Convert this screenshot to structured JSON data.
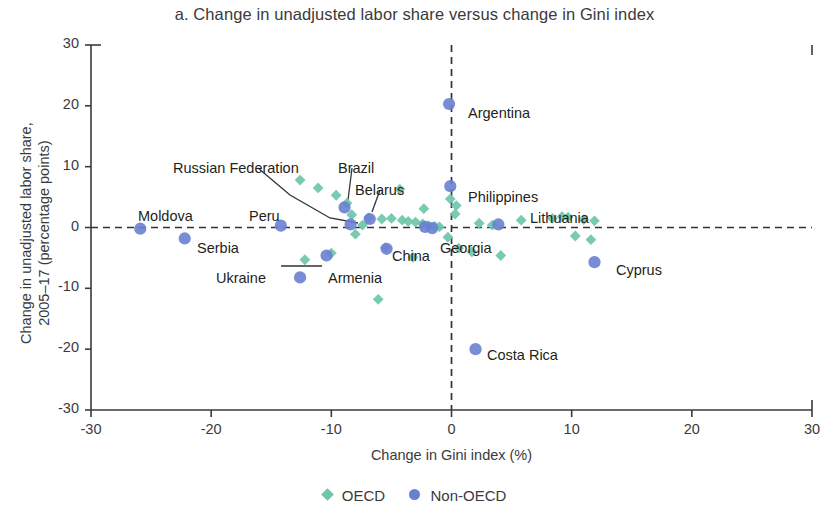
{
  "chart_data": {
    "type": "scatter",
    "title": "a. Change in unadjusted labor share versus change in Gini index",
    "xlabel": "Change in Gini index (%)",
    "ylabel": "Change in unadjusted labor share, 2005–17 (percentage points)",
    "ylabel_line1": "Change in unadjusted labor share,",
    "ylabel_line2": "2005–17 (percentage points)",
    "xlim": [
      -30,
      30
    ],
    "ylim": [
      -30,
      30
    ],
    "xticks": [
      "-30",
      "-20",
      "-10",
      "0",
      "10",
      "20",
      "30"
    ],
    "xtick_values": [
      -30,
      -20,
      -10,
      0,
      10,
      20,
      30
    ],
    "yticks": [
      "30",
      "20",
      "10",
      "0",
      "-10",
      "-20",
      "-30"
    ],
    "ytick_values": [
      30,
      20,
      10,
      0,
      -10,
      -20,
      -30
    ],
    "grid": false,
    "reference_lines": [
      {
        "axis": "y",
        "value": 0,
        "style": "dashed"
      },
      {
        "axis": "x",
        "value": 0,
        "style": "dashed"
      }
    ],
    "legend_position": "bottom-center",
    "colors": {
      "oecd": "#6ec5ab",
      "non_oecd": "#6a7fd2",
      "axis": "#3a3a3c",
      "text": "#231f20"
    },
    "series": [
      {
        "name": "OECD",
        "marker": "diamond",
        "color": "#6ec5ab",
        "points": [
          {
            "x": -12.6,
            "y": 7.8
          },
          {
            "x": -11.1,
            "y": 6.5
          },
          {
            "x": -9.6,
            "y": 5.3
          },
          {
            "x": -8.7,
            "y": 4.0
          },
          {
            "x": -8.3,
            "y": 2.1
          },
          {
            "x": -7.4,
            "y": 0.4
          },
          {
            "x": -6.9,
            "y": 1.6
          },
          {
            "x": -8.0,
            "y": -1.1
          },
          {
            "x": -5.8,
            "y": 1.4
          },
          {
            "x": -5.0,
            "y": 1.5
          },
          {
            "x": -4.3,
            "y": 6.3
          },
          {
            "x": -4.1,
            "y": 1.2
          },
          {
            "x": -3.6,
            "y": 1.0
          },
          {
            "x": -3.0,
            "y": 0.9
          },
          {
            "x": -2.4,
            "y": 0.6
          },
          {
            "x": -1.9,
            "y": 0.3
          },
          {
            "x": -1.4,
            "y": 0.2
          },
          {
            "x": -1.0,
            "y": 0.1
          },
          {
            "x": -2.3,
            "y": 3.1
          },
          {
            "x": -0.1,
            "y": 4.7
          },
          {
            "x": 0.4,
            "y": 3.6
          },
          {
            "x": 0.3,
            "y": 2.2
          },
          {
            "x": -0.3,
            "y": -1.6
          },
          {
            "x": 0.6,
            "y": -3.4
          },
          {
            "x": 1.7,
            "y": -4.0
          },
          {
            "x": 2.3,
            "y": 0.7
          },
          {
            "x": 3.4,
            "y": 0.4
          },
          {
            "x": 4.1,
            "y": -4.6
          },
          {
            "x": 5.8,
            "y": 1.2
          },
          {
            "x": 8.4,
            "y": 1.5
          },
          {
            "x": 9.2,
            "y": 1.8
          },
          {
            "x": 9.7,
            "y": 1.7
          },
          {
            "x": 11.0,
            "y": 1.3
          },
          {
            "x": 11.9,
            "y": 1.1
          },
          {
            "x": 10.3,
            "y": -1.4
          },
          {
            "x": 11.6,
            "y": -2.0
          },
          {
            "x": -12.2,
            "y": -5.3
          },
          {
            "x": -10.0,
            "y": -4.2
          },
          {
            "x": -6.1,
            "y": -11.8
          },
          {
            "x": -3.2,
            "y": -4.9
          },
          {
            "x": -5.5,
            "y": -3.3
          }
        ]
      },
      {
        "name": "Non-OECD",
        "marker": "circle",
        "color": "#6a7fd2",
        "points": [
          {
            "x": -25.9,
            "y": -0.2
          },
          {
            "x": -22.2,
            "y": -1.8
          },
          {
            "x": -14.2,
            "y": 0.3
          },
          {
            "x": -12.6,
            "y": -8.2
          },
          {
            "x": -10.4,
            "y": -4.6
          },
          {
            "x": -8.9,
            "y": 3.3
          },
          {
            "x": -8.4,
            "y": 0.5
          },
          {
            "x": -6.8,
            "y": 1.4
          },
          {
            "x": -5.4,
            "y": -3.5
          },
          {
            "x": -2.2,
            "y": 0.1
          },
          {
            "x": -1.6,
            "y": -0.1
          },
          {
            "x": -0.2,
            "y": 20.3
          },
          {
            "x": -0.1,
            "y": 6.8
          },
          {
            "x": 3.9,
            "y": 0.5
          },
          {
            "x": 11.9,
            "y": -5.7
          },
          {
            "x": 2.0,
            "y": -20.0
          }
        ]
      }
    ],
    "annotations": [
      {
        "label": "Moldova",
        "x_px": 138,
        "y_px": 208,
        "anchor": "start",
        "leader": null
      },
      {
        "label": "Serbia",
        "x_px": 197,
        "y_px": 240,
        "anchor": "start",
        "leader": null
      },
      {
        "label": "Peru",
        "x_px": 249,
        "y_px": 208,
        "anchor": "start",
        "leader": null
      },
      {
        "label": "Russian Federation",
        "x_px": 173,
        "y_px": 160,
        "anchor": "start",
        "leader": [
          [
            258,
            168
          ],
          [
            290,
            195
          ],
          [
            330,
            218
          ],
          [
            358,
            223
          ]
        ]
      },
      {
        "label": "Brazil",
        "x_px": 338,
        "y_px": 160,
        "anchor": "start",
        "leader": [
          [
            352,
            168
          ],
          [
            348,
            200
          ]
        ]
      },
      {
        "label": "Belarus",
        "x_px": 355,
        "y_px": 182,
        "anchor": "start",
        "leader": [
          [
            380,
            190
          ],
          [
            372,
            212
          ]
        ]
      },
      {
        "label": "Ukraine",
        "x_px": 216,
        "y_px": 270,
        "anchor": "start",
        "leader": [
          [
            281,
            266
          ],
          [
            322,
            266
          ]
        ]
      },
      {
        "label": "Armenia",
        "x_px": 328,
        "y_px": 270,
        "anchor": "start",
        "leader": null
      },
      {
        "label": "China",
        "x_px": 392,
        "y_px": 248,
        "anchor": "start",
        "leader": null
      },
      {
        "label": "Georgia",
        "x_px": 440,
        "y_px": 240,
        "anchor": "start",
        "leader": null
      },
      {
        "label": "Argentina",
        "x_px": 468,
        "y_px": 105,
        "anchor": "start",
        "leader": null
      },
      {
        "label": "Philippines",
        "x_px": 468,
        "y_px": 189,
        "anchor": "start",
        "leader": null
      },
      {
        "label": "Lithuania",
        "x_px": 530,
        "y_px": 210,
        "anchor": "start",
        "leader": null
      },
      {
        "label": "Cyprus",
        "x_px": 616,
        "y_px": 262,
        "anchor": "start",
        "leader": null
      },
      {
        "label": "Costa Rica",
        "x_px": 487,
        "y_px": 347,
        "anchor": "start",
        "leader": null
      }
    ],
    "legend": [
      {
        "label": "OECD",
        "marker": "diamond",
        "color": "#6ec5ab"
      },
      {
        "label": "Non-OECD",
        "marker": "circle",
        "color": "#6a7fd2"
      }
    ]
  }
}
